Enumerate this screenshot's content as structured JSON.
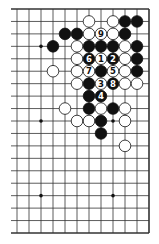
{
  "diagram": {
    "type": "go-board-fragment",
    "board_size": 19,
    "visible_columns": [
      8,
      19
    ],
    "visible_rows": [
      1,
      19
    ],
    "right_edge": true,
    "top_edge": true,
    "bottom_edge": true,
    "left_edge": false,
    "colors": {
      "black": "#111111",
      "white": "#ffffff",
      "line": "#333333",
      "background": "#ffffff"
    },
    "hoshi": [
      [
        10,
        4
      ],
      [
        16,
        4
      ],
      [
        10,
        10
      ],
      [
        16,
        10
      ],
      [
        10,
        16
      ],
      [
        16,
        16
      ]
    ],
    "stones": [
      {
        "col": 14,
        "row": 2,
        "color": "white"
      },
      {
        "col": 16,
        "row": 2,
        "color": "white"
      },
      {
        "col": 17,
        "row": 2,
        "color": "black"
      },
      {
        "col": 18,
        "row": 2,
        "color": "black"
      },
      {
        "col": 12,
        "row": 3,
        "color": "black"
      },
      {
        "col": 13,
        "row": 3,
        "color": "black"
      },
      {
        "col": 14,
        "row": 3,
        "color": "white"
      },
      {
        "col": 15,
        "row": 3,
        "color": "white",
        "label": "9"
      },
      {
        "col": 16,
        "row": 3,
        "color": "white"
      },
      {
        "col": 17,
        "row": 3,
        "color": "black"
      },
      {
        "col": 11,
        "row": 4,
        "color": "black"
      },
      {
        "col": 13,
        "row": 4,
        "color": "white"
      },
      {
        "col": 14,
        "row": 4,
        "color": "black"
      },
      {
        "col": 15,
        "row": 4,
        "color": "black"
      },
      {
        "col": 16,
        "row": 4,
        "color": "black"
      },
      {
        "col": 17,
        "row": 4,
        "color": "white"
      },
      {
        "col": 18,
        "row": 4,
        "color": "black"
      },
      {
        "col": 13,
        "row": 5,
        "color": "white"
      },
      {
        "col": 14,
        "row": 5,
        "color": "black",
        "label": "6"
      },
      {
        "col": 15,
        "row": 5,
        "color": "white",
        "label": "1"
      },
      {
        "col": 16,
        "row": 5,
        "color": "black",
        "label": "2"
      },
      {
        "col": 17,
        "row": 5,
        "color": "white"
      },
      {
        "col": 18,
        "row": 5,
        "color": "black"
      },
      {
        "col": 11,
        "row": 6,
        "color": "white"
      },
      {
        "col": 13,
        "row": 6,
        "color": "white"
      },
      {
        "col": 14,
        "row": 6,
        "color": "white",
        "label": "7"
      },
      {
        "col": 15,
        "row": 6,
        "color": "black"
      },
      {
        "col": 16,
        "row": 6,
        "color": "white",
        "label": "5"
      },
      {
        "col": 17,
        "row": 6,
        "color": "white"
      },
      {
        "col": 18,
        "row": 6,
        "color": "black"
      },
      {
        "col": 13,
        "row": 7,
        "color": "white"
      },
      {
        "col": 14,
        "row": 7,
        "color": "black"
      },
      {
        "col": 15,
        "row": 7,
        "color": "white",
        "label": "3"
      },
      {
        "col": 16,
        "row": 7,
        "color": "black",
        "label": "8"
      },
      {
        "col": 17,
        "row": 7,
        "color": "white"
      },
      {
        "col": 18,
        "row": 7,
        "color": "white"
      },
      {
        "col": 14,
        "row": 8,
        "color": "black"
      },
      {
        "col": 15,
        "row": 8,
        "color": "black",
        "label": "4"
      },
      {
        "col": 12,
        "row": 9,
        "color": "white"
      },
      {
        "col": 14,
        "row": 9,
        "color": "black"
      },
      {
        "col": 15,
        "row": 9,
        "color": "white"
      },
      {
        "col": 16,
        "row": 9,
        "color": "black"
      },
      {
        "col": 17,
        "row": 9,
        "color": "white"
      },
      {
        "col": 13,
        "row": 10,
        "color": "white"
      },
      {
        "col": 14,
        "row": 10,
        "color": "white"
      },
      {
        "col": 15,
        "row": 10,
        "color": "black"
      },
      {
        "col": 17,
        "row": 10,
        "color": "white"
      },
      {
        "col": 15,
        "row": 11,
        "color": "black"
      },
      {
        "col": 17,
        "row": 12,
        "color": "white"
      }
    ]
  }
}
